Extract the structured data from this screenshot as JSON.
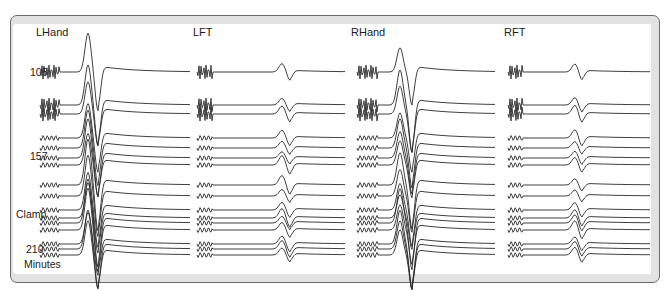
{
  "figure": {
    "panels": [
      {
        "id": "lhand",
        "label": "LHand",
        "x": 36,
        "y": 26
      },
      {
        "id": "lft",
        "label": "LFT",
        "x": 193,
        "y": 26
      },
      {
        "id": "rhand",
        "label": "RHand",
        "x": 351,
        "y": 26
      },
      {
        "id": "rft",
        "label": "RFT",
        "x": 504,
        "y": 26
      }
    ],
    "row_labels": [
      {
        "text": "105",
        "x": 30,
        "y": 66
      },
      {
        "text": "157",
        "x": 30,
        "y": 150
      },
      {
        "text": "Clamp",
        "x": 16,
        "y": 208
      },
      {
        "text": "210",
        "x": 26,
        "y": 243
      },
      {
        "text": "Minutes",
        "x": 24,
        "y": 258
      }
    ],
    "colors": {
      "trace": "#2a2a2a",
      "frame_border": "#6a6a6a",
      "frame_band": "#e2e2e2",
      "background": "#ffffff"
    }
  },
  "chart_data": {
    "type": "line",
    "title": "",
    "panels": [
      "LHand",
      "LFT",
      "RHand",
      "RFT"
    ],
    "ylabel": "Minutes",
    "time_markers": [
      "105",
      "157",
      "Clamp",
      "210"
    ],
    "trace_baselines_y": [
      72,
      105,
      114,
      138,
      148,
      158,
      165,
      185,
      196,
      210,
      218,
      223,
      230,
      244,
      249,
      255
    ],
    "traces": {
      "LHand": {
        "x0": 40,
        "x1": 190,
        "stim_end": 60,
        "peak_x": 88,
        "trough_x": 98,
        "amp_peak": 30,
        "amp_trough": 30
      },
      "LFT": {
        "x0": 197,
        "x1": 345,
        "stim_end": 213,
        "peak_x": 282,
        "trough_x": 290,
        "amp_peak": 6,
        "amp_trough": 6
      },
      "RHand": {
        "x0": 357,
        "x1": 495,
        "stim_end": 378,
        "peak_x": 400,
        "trough_x": 412,
        "amp_peak": 22,
        "amp_trough": 30
      },
      "RFT": {
        "x0": 508,
        "x1": 650,
        "stim_end": 523,
        "peak_x": 575,
        "trough_x": 582,
        "amp_peak": 6,
        "amp_trough": 6
      }
    }
  }
}
